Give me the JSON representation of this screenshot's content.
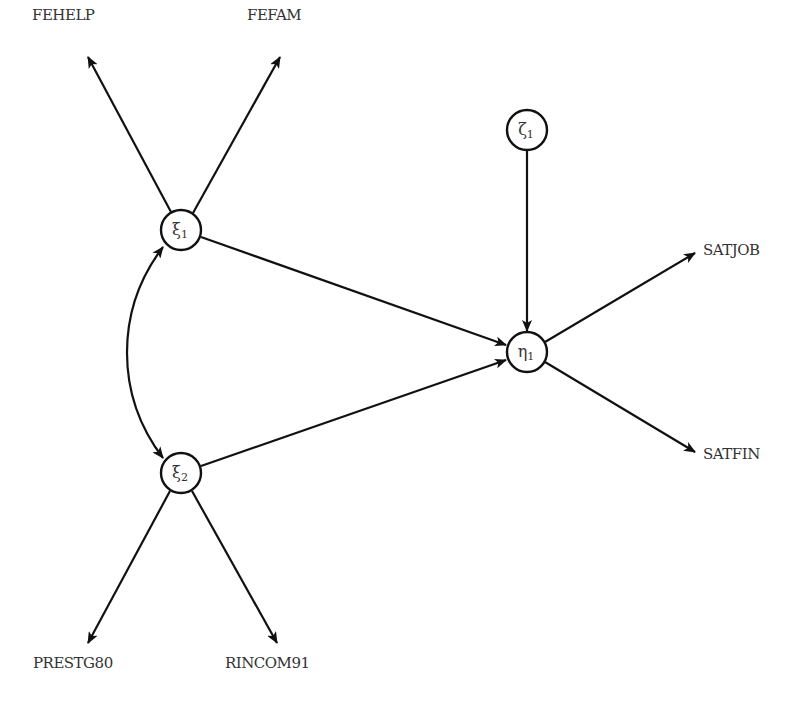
{
  "diagram": {
    "type": "structural-equation-model",
    "title_fragment": "",
    "colors": {
      "stroke": "#111111",
      "text": "#333333",
      "background": "#ffffff"
    },
    "latent_nodes": [
      {
        "id": "xi1",
        "symbol": "ξ",
        "subscript": "1",
        "cx": 181,
        "cy": 230,
        "r": 20
      },
      {
        "id": "xi2",
        "symbol": "ξ",
        "subscript": "2",
        "cx": 181,
        "cy": 473,
        "r": 20
      },
      {
        "id": "eta1",
        "symbol": "η",
        "subscript": "1",
        "cx": 527,
        "cy": 352,
        "r": 20
      },
      {
        "id": "zeta1",
        "symbol": "ζ",
        "subscript": "1",
        "cx": 527,
        "cy": 130,
        "r": 20
      }
    ],
    "observed_labels": [
      {
        "id": "fehelp",
        "text": "FEHELP",
        "x": 32,
        "y": 8
      },
      {
        "id": "fefam",
        "text": "FEFAM",
        "x": 247,
        "y": 8
      },
      {
        "id": "satjob",
        "text": "SATJOB",
        "x": 703,
        "y": 243
      },
      {
        "id": "satfin",
        "text": "SATFIN",
        "x": 703,
        "y": 447
      },
      {
        "id": "prestg80",
        "text": "PRESTG80",
        "x": 33,
        "y": 656
      },
      {
        "id": "rincom91",
        "text": "RINCOM91",
        "x": 225,
        "y": 656
      }
    ],
    "edges": [
      {
        "from": "xi1",
        "to": "FEHELP",
        "kind": "directed"
      },
      {
        "from": "xi1",
        "to": "FEFAM",
        "kind": "directed"
      },
      {
        "from": "xi1",
        "to": "eta1",
        "kind": "directed"
      },
      {
        "from": "xi2",
        "to": "eta1",
        "kind": "directed"
      },
      {
        "from": "xi2",
        "to": "PRESTG80",
        "kind": "directed"
      },
      {
        "from": "xi2",
        "to": "RINCOM91",
        "kind": "directed"
      },
      {
        "from": "zeta1",
        "to": "eta1",
        "kind": "directed"
      },
      {
        "from": "eta1",
        "to": "SATJOB",
        "kind": "directed"
      },
      {
        "from": "eta1",
        "to": "SATFIN",
        "kind": "directed"
      },
      {
        "from": "xi1",
        "to": "xi2",
        "kind": "covariance-curved-bidirectional"
      }
    ]
  }
}
